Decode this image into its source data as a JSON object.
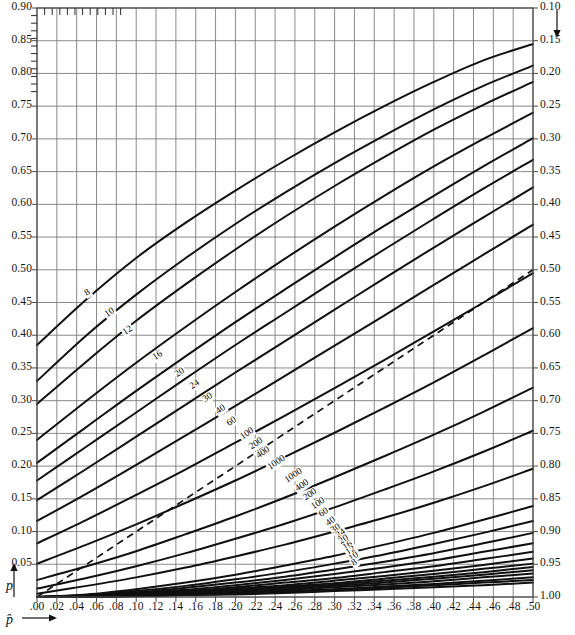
{
  "chart_data": {
    "type": "line",
    "title": "",
    "xlabel": "p̂",
    "ylabel": "p",
    "xlim": [
      0.0,
      0.5
    ],
    "ylim_left": [
      0.9,
      0.0
    ],
    "ylim_right": [
      0.1,
      1.0
    ],
    "grid": true,
    "legend": "none",
    "x_ticks": [
      ".00",
      ".02",
      ".04",
      ".06",
      ".08",
      ".10",
      ".12",
      ".14",
      ".16",
      ".18",
      ".20",
      ".22",
      ".24",
      ".26",
      ".28",
      ".30",
      ".32",
      ".34",
      ".36",
      ".38",
      ".40",
      ".42",
      ".44",
      ".46",
      ".48",
      ".50"
    ],
    "x_tick_values": [
      0.0,
      0.02,
      0.04,
      0.06,
      0.08,
      0.1,
      0.12,
      0.14,
      0.16,
      0.18,
      0.2,
      0.22,
      0.24,
      0.26,
      0.28,
      0.3,
      0.32,
      0.34,
      0.36,
      0.38,
      0.4,
      0.42,
      0.44,
      0.46,
      0.48,
      0.5
    ],
    "y_ticks_left": [
      "0.90",
      "0.85",
      "0.80",
      "0.75",
      "0.70",
      "0.65",
      "0.60",
      "0.55",
      "0.50",
      "0.45",
      "0.40",
      "0.35",
      "0.30",
      "0.25",
      "0.20",
      "0.15",
      "0.10",
      "0.05"
    ],
    "y_tick_values_left": [
      0.9,
      0.85,
      0.8,
      0.75,
      0.7,
      0.65,
      0.6,
      0.55,
      0.5,
      0.45,
      0.4,
      0.35,
      0.3,
      0.25,
      0.2,
      0.15,
      0.1,
      0.05
    ],
    "y_ticks_right": [
      "0.10",
      "0.15",
      "0.20",
      "0.25",
      "0.30",
      "0.35",
      "0.40",
      "0.45",
      "0.50",
      "0.55",
      "0.60",
      "0.65",
      "0.70",
      "0.75",
      "0.80",
      "0.85",
      "0.90",
      "0.95",
      "1.00"
    ],
    "y_tick_values_right": [
      0.1,
      0.15,
      0.2,
      0.25,
      0.3,
      0.35,
      0.4,
      0.45,
      0.5,
      0.55,
      0.6,
      0.65,
      0.7,
      0.75,
      0.8,
      0.85,
      0.9,
      0.95,
      1.0
    ],
    "sample_sizes": [
      8,
      10,
      12,
      16,
      20,
      24,
      30,
      40,
      60,
      100,
      200,
      400,
      1000
    ],
    "upper_band_labels": [
      "8",
      "10",
      "12",
      "16",
      "20",
      "24",
      "30",
      "40",
      "60",
      "100",
      "200",
      "400",
      "1000"
    ],
    "lower_band_labels": [
      "1000",
      "400",
      "200",
      "100",
      "60",
      "40",
      "30",
      "24",
      "20",
      "16",
      "12",
      "10",
      "8"
    ],
    "reference_line": {
      "name": "identity",
      "style": "dashed",
      "from": [
        0.0,
        0.0
      ],
      "to": [
        0.5,
        0.5
      ]
    },
    "series": [
      {
        "name": "n=8 upper",
        "n": 8,
        "band": "upper",
        "x": [
          0.0,
          0.05,
          0.1,
          0.15,
          0.2,
          0.25,
          0.3,
          0.35,
          0.4,
          0.45,
          0.5
        ],
        "y": [
          0.385,
          0.455,
          0.518,
          0.572,
          0.621,
          0.667,
          0.71,
          0.75,
          0.787,
          0.82,
          0.845
        ]
      },
      {
        "name": "n=10 upper",
        "n": 10,
        "band": "upper",
        "x": [
          0.0,
          0.05,
          0.1,
          0.15,
          0.2,
          0.25,
          0.3,
          0.35,
          0.4,
          0.45,
          0.5
        ],
        "y": [
          0.33,
          0.4,
          0.462,
          0.518,
          0.57,
          0.618,
          0.663,
          0.705,
          0.745,
          0.781,
          0.812
        ]
      },
      {
        "name": "n=12 upper",
        "n": 12,
        "band": "upper",
        "x": [
          0.0,
          0.05,
          0.1,
          0.15,
          0.2,
          0.25,
          0.3,
          0.35,
          0.4,
          0.45,
          0.5
        ],
        "y": [
          0.295,
          0.36,
          0.422,
          0.478,
          0.531,
          0.581,
          0.628,
          0.672,
          0.714,
          0.752,
          0.787
        ]
      },
      {
        "name": "n=16 upper",
        "n": 16,
        "band": "upper",
        "x": [
          0.0,
          0.05,
          0.1,
          0.15,
          0.2,
          0.25,
          0.3,
          0.35,
          0.4,
          0.45,
          0.5
        ],
        "y": [
          0.24,
          0.3,
          0.358,
          0.413,
          0.466,
          0.517,
          0.566,
          0.613,
          0.658,
          0.7,
          0.74
        ]
      },
      {
        "name": "n=20 upper",
        "n": 20,
        "band": "upper",
        "x": [
          0.0,
          0.05,
          0.1,
          0.15,
          0.2,
          0.25,
          0.3,
          0.35,
          0.4,
          0.45,
          0.5
        ],
        "y": [
          0.205,
          0.26,
          0.315,
          0.368,
          0.42,
          0.47,
          0.519,
          0.567,
          0.613,
          0.658,
          0.701
        ]
      },
      {
        "name": "n=24 upper",
        "n": 24,
        "band": "upper",
        "x": [
          0.0,
          0.05,
          0.1,
          0.15,
          0.2,
          0.25,
          0.3,
          0.35,
          0.4,
          0.45,
          0.5
        ],
        "y": [
          0.178,
          0.23,
          0.282,
          0.334,
          0.385,
          0.434,
          0.483,
          0.531,
          0.578,
          0.624,
          0.668
        ]
      },
      {
        "name": "n=30 upper",
        "n": 30,
        "band": "upper",
        "x": [
          0.0,
          0.05,
          0.1,
          0.15,
          0.2,
          0.25,
          0.3,
          0.35,
          0.4,
          0.45,
          0.5
        ],
        "y": [
          0.148,
          0.196,
          0.245,
          0.294,
          0.343,
          0.391,
          0.439,
          0.487,
          0.534,
          0.58,
          0.626
        ]
      },
      {
        "name": "n=40 upper",
        "n": 40,
        "band": "upper",
        "x": [
          0.0,
          0.05,
          0.1,
          0.15,
          0.2,
          0.25,
          0.3,
          0.35,
          0.4,
          0.45,
          0.5
        ],
        "y": [
          0.116,
          0.158,
          0.202,
          0.247,
          0.292,
          0.338,
          0.384,
          0.43,
          0.477,
          0.523,
          0.569
        ]
      },
      {
        "name": "n=60 upper",
        "n": 60,
        "band": "upper",
        "x": [
          0.0,
          0.05,
          0.1,
          0.15,
          0.2,
          0.25,
          0.3,
          0.35,
          0.4,
          0.45,
          0.5
        ],
        "y": [
          0.082,
          0.118,
          0.156,
          0.195,
          0.236,
          0.277,
          0.319,
          0.362,
          0.406,
          0.45,
          0.495
        ]
      },
      {
        "name": "n=100 upper",
        "n": 100,
        "band": "upper",
        "x": [
          0.0,
          0.05,
          0.1,
          0.15,
          0.2,
          0.25,
          0.3,
          0.35,
          0.4,
          0.45,
          0.5
        ],
        "y": [
          0.051,
          0.08,
          0.111,
          0.144,
          0.178,
          0.214,
          0.251,
          0.289,
          0.328,
          0.369,
          0.411
        ]
      },
      {
        "name": "n=200 upper",
        "n": 200,
        "band": "upper",
        "x": [
          0.0,
          0.05,
          0.1,
          0.15,
          0.2,
          0.25,
          0.3,
          0.35,
          0.4,
          0.45,
          0.5
        ],
        "y": [
          0.026,
          0.047,
          0.07,
          0.096,
          0.123,
          0.152,
          0.183,
          0.215,
          0.248,
          0.283,
          0.32
        ]
      },
      {
        "name": "n=400 upper",
        "n": 400,
        "band": "upper",
        "x": [
          0.0,
          0.05,
          0.1,
          0.15,
          0.2,
          0.25,
          0.3,
          0.35,
          0.4,
          0.45,
          0.5
        ],
        "y": [
          0.013,
          0.029,
          0.047,
          0.067,
          0.089,
          0.112,
          0.137,
          0.164,
          0.192,
          0.222,
          0.254
        ]
      },
      {
        "name": "n=1000 upper",
        "n": 1000,
        "band": "upper",
        "x": [
          0.0,
          0.05,
          0.1,
          0.15,
          0.2,
          0.25,
          0.3,
          0.35,
          0.4,
          0.45,
          0.5
        ],
        "y": [
          0.005,
          0.017,
          0.03,
          0.045,
          0.062,
          0.08,
          0.1,
          0.121,
          0.144,
          0.169,
          0.196
        ]
      },
      {
        "name": "n=1000 lower",
        "n": 1000,
        "band": "lower",
        "x": [
          0.0,
          0.05,
          0.1,
          0.15,
          0.2,
          0.25,
          0.3,
          0.35,
          0.4,
          0.45,
          0.5
        ],
        "y": [
          0.0,
          0.004,
          0.012,
          0.022,
          0.034,
          0.048,
          0.063,
          0.08,
          0.098,
          0.118,
          0.139
        ]
      },
      {
        "name": "n=400 lower",
        "n": 400,
        "band": "lower",
        "x": [
          0.0,
          0.05,
          0.1,
          0.15,
          0.2,
          0.25,
          0.3,
          0.35,
          0.4,
          0.45,
          0.5
        ],
        "y": [
          0.0,
          0.003,
          0.009,
          0.017,
          0.027,
          0.038,
          0.051,
          0.065,
          0.081,
          0.098,
          0.116
        ]
      },
      {
        "name": "n=200 lower",
        "n": 200,
        "band": "lower",
        "x": [
          0.0,
          0.05,
          0.1,
          0.15,
          0.2,
          0.25,
          0.3,
          0.35,
          0.4,
          0.45,
          0.5
        ],
        "y": [
          0.0,
          0.002,
          0.007,
          0.014,
          0.022,
          0.031,
          0.042,
          0.054,
          0.067,
          0.082,
          0.098
        ]
      },
      {
        "name": "n=100 lower",
        "n": 100,
        "band": "lower",
        "x": [
          0.0,
          0.05,
          0.1,
          0.15,
          0.2,
          0.25,
          0.3,
          0.35,
          0.4,
          0.45,
          0.5
        ],
        "y": [
          0.0,
          0.002,
          0.006,
          0.011,
          0.018,
          0.026,
          0.035,
          0.045,
          0.056,
          0.069,
          0.082
        ]
      },
      {
        "name": "n=60 lower",
        "n": 60,
        "band": "lower",
        "x": [
          0.0,
          0.05,
          0.1,
          0.15,
          0.2,
          0.25,
          0.3,
          0.35,
          0.4,
          0.45,
          0.5
        ],
        "y": [
          0.0,
          0.001,
          0.005,
          0.009,
          0.015,
          0.022,
          0.029,
          0.038,
          0.047,
          0.058,
          0.069
        ]
      },
      {
        "name": "n=40 lower",
        "n": 40,
        "band": "lower",
        "x": [
          0.0,
          0.05,
          0.1,
          0.15,
          0.2,
          0.25,
          0.3,
          0.35,
          0.4,
          0.45,
          0.5
        ],
        "y": [
          0.0,
          0.001,
          0.004,
          0.008,
          0.013,
          0.018,
          0.025,
          0.032,
          0.04,
          0.049,
          0.059
        ]
      },
      {
        "name": "n=30 lower",
        "n": 30,
        "band": "lower",
        "x": [
          0.0,
          0.05,
          0.1,
          0.15,
          0.2,
          0.25,
          0.3,
          0.35,
          0.4,
          0.45,
          0.5
        ],
        "y": [
          0.0,
          0.001,
          0.003,
          0.007,
          0.011,
          0.016,
          0.021,
          0.028,
          0.035,
          0.043,
          0.051
        ]
      },
      {
        "name": "n=24 lower",
        "n": 24,
        "band": "lower",
        "x": [
          0.0,
          0.05,
          0.1,
          0.15,
          0.2,
          0.25,
          0.3,
          0.35,
          0.4,
          0.45,
          0.5
        ],
        "y": [
          0.0,
          0.001,
          0.003,
          0.006,
          0.01,
          0.014,
          0.019,
          0.025,
          0.031,
          0.038,
          0.046
        ]
      },
      {
        "name": "n=20 lower",
        "n": 20,
        "band": "lower",
        "x": [
          0.0,
          0.05,
          0.1,
          0.15,
          0.2,
          0.25,
          0.3,
          0.35,
          0.4,
          0.45,
          0.5
        ],
        "y": [
          0.0,
          0.001,
          0.003,
          0.005,
          0.009,
          0.013,
          0.017,
          0.022,
          0.028,
          0.034,
          0.041
        ]
      },
      {
        "name": "n=16 lower",
        "n": 16,
        "band": "lower",
        "x": [
          0.0,
          0.05,
          0.1,
          0.15,
          0.2,
          0.25,
          0.3,
          0.35,
          0.4,
          0.45,
          0.5
        ],
        "y": [
          0.0,
          0.001,
          0.002,
          0.004,
          0.007,
          0.011,
          0.015,
          0.019,
          0.024,
          0.03,
          0.036
        ]
      },
      {
        "name": "n=12 lower",
        "n": 12,
        "band": "lower",
        "x": [
          0.0,
          0.05,
          0.1,
          0.15,
          0.2,
          0.25,
          0.3,
          0.35,
          0.4,
          0.45,
          0.5
        ],
        "y": [
          0.0,
          0.001,
          0.002,
          0.004,
          0.006,
          0.009,
          0.012,
          0.016,
          0.02,
          0.025,
          0.03
        ]
      },
      {
        "name": "n=10 lower",
        "n": 10,
        "band": "lower",
        "x": [
          0.0,
          0.05,
          0.1,
          0.15,
          0.2,
          0.25,
          0.3,
          0.35,
          0.4,
          0.45,
          0.5
        ],
        "y": [
          0.0,
          0.0,
          0.002,
          0.003,
          0.005,
          0.008,
          0.011,
          0.014,
          0.018,
          0.022,
          0.026
        ]
      },
      {
        "name": "n=8 lower",
        "n": 8,
        "band": "lower",
        "x": [
          0.0,
          0.05,
          0.1,
          0.15,
          0.2,
          0.25,
          0.3,
          0.35,
          0.4,
          0.45,
          0.5
        ],
        "y": [
          0.0,
          0.0,
          0.001,
          0.003,
          0.004,
          0.006,
          0.009,
          0.012,
          0.015,
          0.018,
          0.022
        ]
      }
    ],
    "upper_label_positions": [
      {
        "label": "8",
        "x": 0.056,
        "y": 0.463
      },
      {
        "label": "10",
        "x": 0.077,
        "y": 0.432
      },
      {
        "label": "12",
        "x": 0.095,
        "y": 0.405
      },
      {
        "label": "16",
        "x": 0.125,
        "y": 0.366
      },
      {
        "label": "20",
        "x": 0.147,
        "y": 0.34
      },
      {
        "label": "24",
        "x": 0.162,
        "y": 0.322
      },
      {
        "label": "30",
        "x": 0.175,
        "y": 0.303
      },
      {
        "label": "40",
        "x": 0.189,
        "y": 0.284
      },
      {
        "label": "60",
        "x": 0.2,
        "y": 0.266
      },
      {
        "label": "100",
        "x": 0.213,
        "y": 0.247
      },
      {
        "label": "200",
        "x": 0.222,
        "y": 0.232
      },
      {
        "label": "400",
        "x": 0.229,
        "y": 0.219
      },
      {
        "label": "1000",
        "x": 0.24,
        "y": 0.203
      }
    ],
    "lower_label_positions": [
      {
        "label": "1000",
        "x": 0.257,
        "y": 0.183
      },
      {
        "label": "400",
        "x": 0.268,
        "y": 0.168
      },
      {
        "label": "200",
        "x": 0.276,
        "y": 0.155
      },
      {
        "label": "100",
        "x": 0.284,
        "y": 0.141
      },
      {
        "label": "60",
        "x": 0.292,
        "y": 0.127
      },
      {
        "label": "40",
        "x": 0.299,
        "y": 0.113
      },
      {
        "label": "30",
        "x": 0.304,
        "y": 0.103
      },
      {
        "label": "24",
        "x": 0.309,
        "y": 0.094
      },
      {
        "label": "20",
        "x": 0.313,
        "y": 0.086
      },
      {
        "label": "16",
        "x": 0.317,
        "y": 0.077
      },
      {
        "label": "12",
        "x": 0.32,
        "y": 0.068
      },
      {
        "label": "10",
        "x": 0.323,
        "y": 0.06
      },
      {
        "label": "8",
        "x": 0.326,
        "y": 0.05
      }
    ],
    "colors": {
      "curve": "#101010",
      "grid": "#7d7d7d",
      "axis": "#4a4a4a",
      "dashed": "#101010",
      "background": "#ffffff",
      "text": "#141414"
    }
  }
}
